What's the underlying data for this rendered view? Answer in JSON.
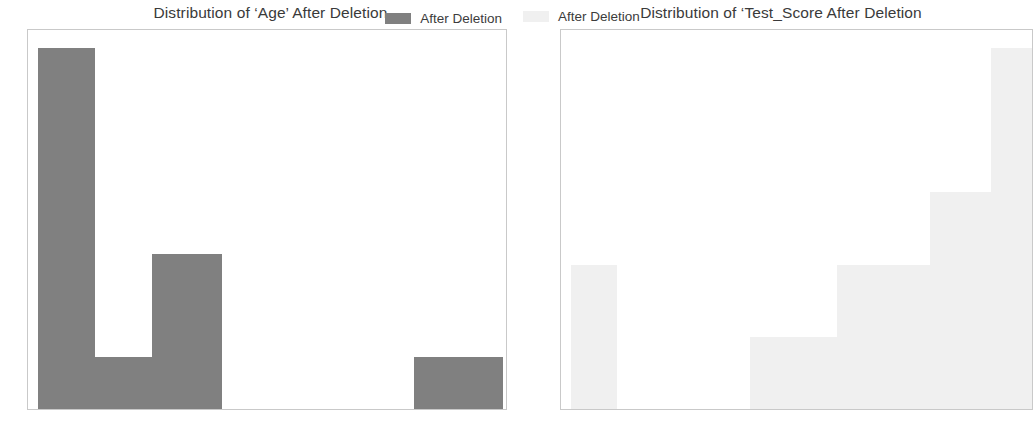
{
  "figure": {
    "background": "#ffffff",
    "width": 1033,
    "height": 439
  },
  "panels": [
    {
      "id": "age",
      "title": "Distribution of ‘Age’ After Deletion",
      "legend_label": "After Deletion",
      "bar_color": "#808080",
      "ytick_labels": [
        "0",
        "1",
        "2",
        "3",
        "4",
        "5",
        "6",
        "7"
      ],
      "xtick_labels": [
        "20",
        "30",
        "40",
        "50",
        "60",
        "70",
        "80",
        "90"
      ]
    },
    {
      "id": "test_score",
      "title": "Distribution of ‘Test_Score After Deletion",
      "legend_label": "After Deletion",
      "bar_color": "#f0f0f0",
      "ytick_labels": [
        "0",
        "1",
        "2",
        "3",
        "4",
        "5"
      ],
      "xtick_labels": [
        "20",
        "40",
        "60",
        "80"
      ]
    }
  ],
  "chart_data": [
    {
      "type": "bar",
      "id": "age",
      "title": "Distribution of ‘Age’ After Deletion",
      "xlabel": "",
      "ylabel": "",
      "legend": [
        "After Deletion"
      ],
      "legend_position": "upper right",
      "grid": false,
      "color": "#808080",
      "xlim": [
        15.5,
        90.5
      ],
      "ylim": [
        0,
        7.35
      ],
      "xticks": [
        20,
        30,
        40,
        50,
        60,
        70,
        80,
        90
      ],
      "yticks": [
        0,
        1,
        2,
        3,
        4,
        5,
        6,
        7
      ],
      "bin_edges": [
        17,
        26,
        35,
        46,
        55,
        64,
        73,
        76,
        90
      ],
      "bars": [
        {
          "x0": 17,
          "x1": 26,
          "height": 7
        },
        {
          "x0": 26,
          "x1": 35,
          "height": 1
        },
        {
          "x0": 35,
          "x1": 46,
          "height": 3
        },
        {
          "x0": 46,
          "x1": 55,
          "height": 0
        },
        {
          "x0": 55,
          "x1": 64,
          "height": 0
        },
        {
          "x0": 64,
          "x1": 73,
          "height": 0
        },
        {
          "x0": 73,
          "x1": 76,
          "height": 0
        },
        {
          "x0": 76,
          "x1": 90,
          "height": 1
        }
      ],
      "values": [
        7,
        1,
        3,
        0,
        0,
        0,
        0,
        1
      ]
    },
    {
      "type": "bar",
      "id": "test_score",
      "title": "Distribution of ‘Test_Score After Deletion",
      "xlabel": "",
      "ylabel": "",
      "legend": [
        "After Deletion"
      ],
      "legend_position": "upper left",
      "grid": false,
      "color": "#f0f0f0",
      "xlim": [
        3,
        95
      ],
      "ylim": [
        0,
        5.25
      ],
      "xticks": [
        20,
        40,
        60,
        80
      ],
      "yticks": [
        0,
        1,
        2,
        3,
        4,
        5
      ],
      "bin_edges": [
        5,
        14,
        40,
        57,
        75,
        87,
        95
      ],
      "bars": [
        {
          "x0": 5,
          "x1": 14,
          "height": 2
        },
        {
          "x0": 14,
          "x1": 40,
          "height": 0
        },
        {
          "x0": 40,
          "x1": 57,
          "height": 1
        },
        {
          "x0": 57,
          "x1": 75,
          "height": 2
        },
        {
          "x0": 75,
          "x1": 87,
          "height": 3
        },
        {
          "x0": 87,
          "x1": 95,
          "height": 5
        }
      ],
      "values": [
        2,
        0,
        1,
        2,
        3,
        5
      ]
    }
  ]
}
